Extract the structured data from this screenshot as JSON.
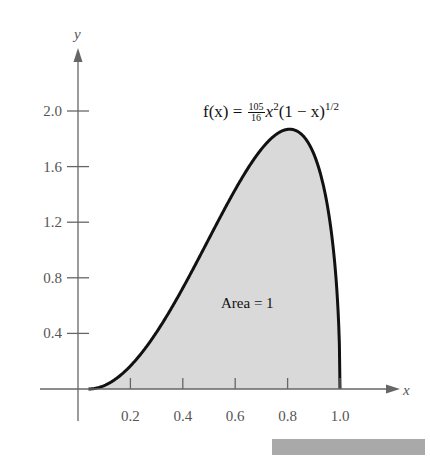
{
  "chart_data": {
    "type": "area",
    "function": {
      "expression_prefix": "f(x) = ",
      "coef_num": "105",
      "coef_den": "16",
      "base1": "x",
      "exp1": "2",
      "factor": "(1 − x)",
      "exp2": "1/2"
    },
    "xlabel": "x",
    "ylabel": "y",
    "xlim": [
      0,
      1.1
    ],
    "ylim": [
      0,
      2.2
    ],
    "x_ticks": [
      "0.2",
      "0.4",
      "0.6",
      "0.8",
      "1.0"
    ],
    "y_ticks": [
      "0.4",
      "0.8",
      "1.2",
      "1.6",
      "2.0"
    ],
    "grid": false,
    "annotation": "Area = 1",
    "shaded_region": [
      0,
      1
    ],
    "series": [
      {
        "name": "f(x)",
        "x": [
          0,
          0.1,
          0.2,
          0.3,
          0.4,
          0.5,
          0.6,
          0.7,
          0.8,
          0.9,
          0.95,
          1.0
        ],
        "values": [
          0,
          0.062,
          0.235,
          0.494,
          0.813,
          1.16,
          1.494,
          1.759,
          1.878,
          1.681,
          1.326,
          0
        ]
      }
    ],
    "colors": {
      "curve": "#111111",
      "fill": "#d9d9d9",
      "axis": "#666666",
      "bar": "#a9a9a9"
    }
  }
}
